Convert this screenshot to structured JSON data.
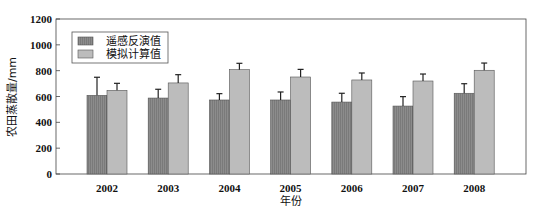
{
  "chart_data": {
    "type": "bar",
    "title": "",
    "xlabel": "年份",
    "ylabel": "农田蒸散量/mm",
    "ylim": [
      0,
      1200
    ],
    "yticks": [
      0,
      200,
      400,
      600,
      800,
      1000,
      1200
    ],
    "categories": [
      "2002",
      "2003",
      "2004",
      "2005",
      "2006",
      "2007",
      "2008"
    ],
    "series": [
      {
        "name": "遥感反演值",
        "color": "#8c8c8c",
        "values": [
          609,
          588,
          573,
          573,
          557,
          526,
          625
        ],
        "error_upper": [
          749,
          656,
          622,
          635,
          625,
          599,
          699
        ]
      },
      {
        "name": "模拟计算值",
        "color": "#bcbcbc",
        "values": [
          648,
          705,
          808,
          751,
          728,
          720,
          803
        ],
        "error_upper": [
          702,
          769,
          857,
          810,
          782,
          774,
          859
        ]
      }
    ],
    "legend_position": "upper-left",
    "grid": false,
    "error_bars": true
  }
}
